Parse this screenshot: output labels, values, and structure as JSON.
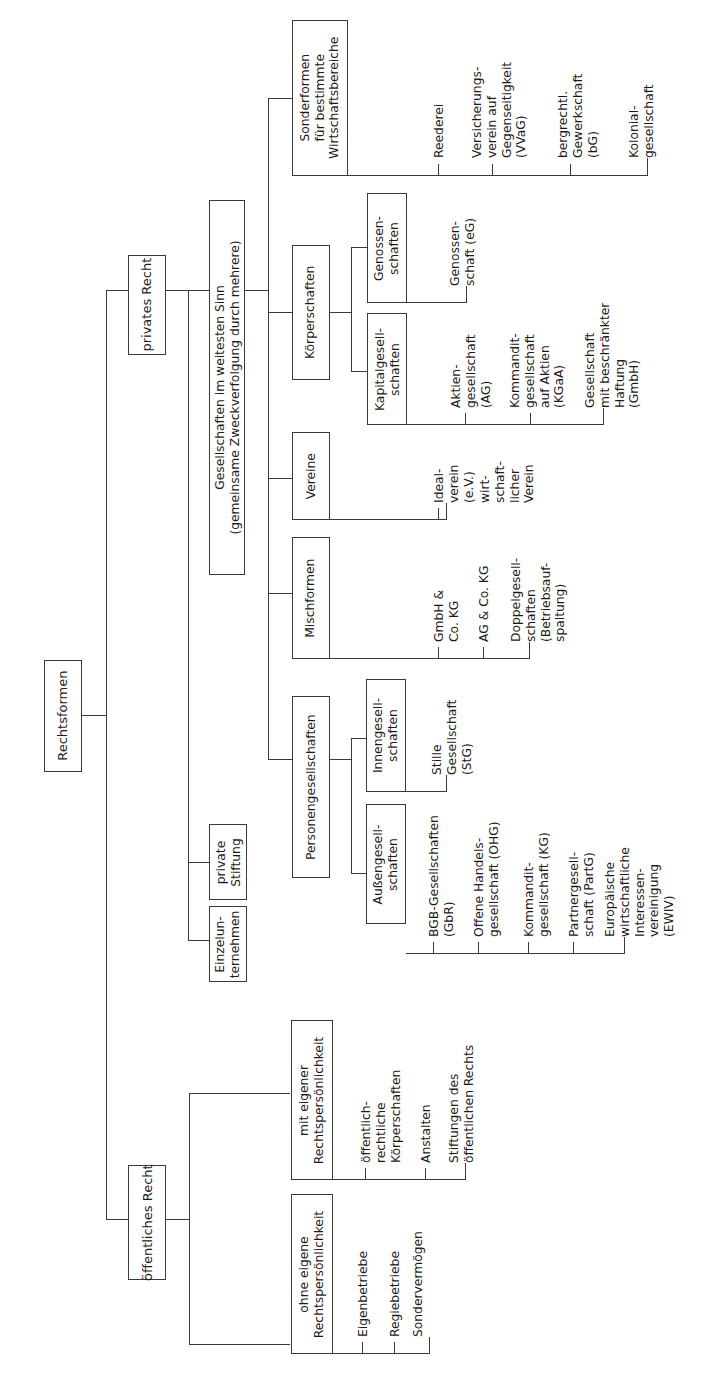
{
  "diagram": {
    "title": "Rechtsformen",
    "language": "de",
    "orientation": "rotated-90-ccw",
    "line_color": "#3a3a3a",
    "background": "#ffffff",
    "text_color": "#1a1a1a"
  },
  "root": {
    "label": "Rechtsformen"
  },
  "branches": {
    "private_law": {
      "label": "privates Recht"
    },
    "public_law": {
      "label": "öffentliches Recht"
    }
  },
  "private_law_children": [
    {
      "label": "Gesellschaften im weitesten Sinn\n(gemeinsame Zweckverfolgung durch mehrere)"
    },
    {
      "label": "private\nStiftung"
    },
    {
      "label": "Einzelun-\nternehmen"
    }
  ],
  "gesellschaften_children": [
    {
      "label": "Sonderformen\nfür bestimmte\nWirtschaftsbereiche"
    },
    {
      "label": "Körperschaften"
    },
    {
      "label": "Vereine"
    },
    {
      "label": "Mischformen"
    },
    {
      "label": "Personengesellschaften"
    }
  ],
  "sonderformen_items": [
    {
      "label": "Reederei"
    },
    {
      "label": "Versicherungs-\nverein auf\nGegenseitigkeit\n(VVaG)"
    },
    {
      "label": "bergrechtl.\nGewerkschaft\n(bG)"
    },
    {
      "label": "Kolonial-\ngesellschaft"
    }
  ],
  "koerperschaften_children": [
    {
      "label": "Genossen-\nschaften"
    },
    {
      "label": "Kapitalgesell-\nschaften"
    }
  ],
  "genossenschaften_items": [
    {
      "label": "Genossen-\nschaft (eG)"
    }
  ],
  "kapitalgesellschaften_items": [
    {
      "label": "Aktien-\ngesellschaft\n(AG)"
    },
    {
      "label": "Kommandit-\ngesellschaft\nauf Aktien\n(KGaA)"
    },
    {
      "label": "Gesellschaft\nmit beschränkter\nHaftung\n(GmbH)"
    }
  ],
  "vereine_items": [
    {
      "label": "Ideal-\nverein\n(e.V.)"
    },
    {
      "label": "wirt-\nschaft-\nlicher\nVerein"
    }
  ],
  "mischformen_items": [
    {
      "label": "GmbH &\nCo. KG"
    },
    {
      "label": "AG & Co. KG"
    },
    {
      "label": "Doppelgesell-\nschaften\n(Betriebsauf-\nspaltung)"
    }
  ],
  "personengesellschaften_children": [
    {
      "label": "Innengesell-\nschaften"
    },
    {
      "label": "Außengesell-\nschaften"
    }
  ],
  "innengesellschaften_items": [
    {
      "label": "Stille\nGesellschaft\n(StG)"
    }
  ],
  "aussengesellschaften_items": [
    {
      "label": "BGB-Gesellschaften\n(GbR)"
    },
    {
      "label": "Offene Handels-\ngesellschaft (OHG)"
    },
    {
      "label": "Kommandit-\ngesellschaft (KG)"
    },
    {
      "label": "Partnergesell-\nschaft (PartG)"
    },
    {
      "label": "Europäische\nwirtschaftliche\nInteressen-\nvereinigung\n(EWIV)"
    }
  ],
  "public_law_children": [
    {
      "label": "mit eigener\nRechtspersönlichkeit"
    },
    {
      "label": "ohne eigene\nRechtspersönlichkeit"
    }
  ],
  "mit_rechtspersoenlichkeit_items": [
    {
      "label": "öffentlich-\nrechtliche\nKörperschaften"
    },
    {
      "label": "Anstalten"
    },
    {
      "label": "Stiftungen des\nöffentlichen Rechts"
    }
  ],
  "ohne_rechtspersoenlichkeit_items": [
    {
      "label": "Eigenbetriebe"
    },
    {
      "label": "Regiebetriebe"
    },
    {
      "label": "Sondervermögen"
    }
  ]
}
